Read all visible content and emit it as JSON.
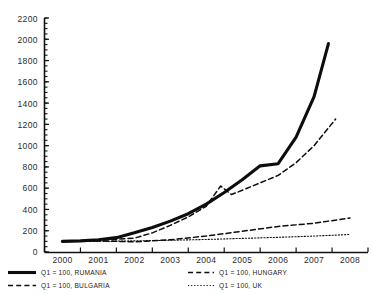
{
  "chart_data": {
    "type": "line",
    "title": "",
    "xlabel": "",
    "ylabel": "",
    "grid": false,
    "legend_position": "bottom",
    "x": [
      2000,
      2001,
      2002,
      2003,
      2004,
      2005,
      2006,
      2007,
      2008
    ],
    "xlim": [
      2000,
      2008
    ],
    "ylim": [
      0,
      2200
    ],
    "ytick_labels": [
      "2200",
      "2000",
      "1800",
      "1600",
      "1400",
      "1200",
      "1000",
      "800",
      "600",
      "400",
      "200",
      "0"
    ],
    "ytick_values": [
      2200,
      2000,
      1800,
      1600,
      1400,
      1200,
      1000,
      800,
      600,
      400,
      200,
      0
    ],
    "ytick_step": 200,
    "xtick_labels": [
      "2000",
      "2001",
      "2002",
      "2003",
      "2004",
      "2005",
      "2006",
      "2007",
      "2008"
    ],
    "series": [
      {
        "name": "Q1 = 100, RUMANIA",
        "style": "solid-thick",
        "x": [
          2000,
          2000.5,
          2001,
          2001.5,
          2002,
          2002.5,
          2003,
          2003.5,
          2004,
          2004.5,
          2005,
          2005.5,
          2006,
          2006.5,
          2007,
          2007.4
        ],
        "values": [
          100,
          105,
          115,
          135,
          180,
          230,
          290,
          360,
          450,
          560,
          680,
          810,
          830,
          1080,
          1460,
          1960
        ]
      },
      {
        "name": "Q1 = 100, BULGARIA",
        "style": "dashed",
        "x": [
          2000,
          2001,
          2002,
          2003,
          2004,
          2005,
          2006,
          2007,
          2008
        ],
        "values": [
          100,
          105,
          95,
          115,
          150,
          195,
          240,
          270,
          320
        ]
      },
      {
        "name": "Q1 = 100, HUNGARY",
        "style": "dashed",
        "x": [
          2000,
          2001,
          2002,
          2002.5,
          2003,
          2003.5,
          2004,
          2004.4,
          2004.7,
          2005,
          2005.5,
          2006,
          2006.5,
          2007,
          2007.6
        ],
        "values": [
          100,
          110,
          130,
          180,
          250,
          330,
          430,
          620,
          540,
          580,
          650,
          720,
          840,
          1000,
          1250
        ]
      },
      {
        "name": "Q1 = 100, UK",
        "style": "dotted",
        "x": [
          2000,
          2001,
          2002,
          2003,
          2004,
          2005,
          2006,
          2007,
          2008
        ],
        "values": [
          100,
          100,
          105,
          110,
          118,
          128,
          138,
          150,
          165
        ]
      }
    ]
  },
  "axis": {
    "y_labels": [
      "2200",
      "2000",
      "1800",
      "1600",
      "1400",
      "1200",
      "1000",
      "800",
      "600",
      "400",
      "200",
      "0"
    ],
    "x_labels": [
      "2000",
      "2001",
      "2002",
      "2003",
      "2004",
      "2005",
      "2006",
      "2007",
      "2008"
    ]
  },
  "legend": {
    "items": [
      {
        "label": "Q1 = 100, RUMANIA",
        "style": "solid-thick",
        "column": "left"
      },
      {
        "label": "Q1 = 100, BULGARIA",
        "style": "dashed",
        "column": "left"
      },
      {
        "label": "Q1 = 100, HUNGARY",
        "style": "dashed",
        "column": "right"
      },
      {
        "label": "Q1 = 100, UK",
        "style": "dotted",
        "column": "right"
      }
    ]
  },
  "colors": {
    "ink": "#0d0d0d",
    "background": "#ffffff",
    "text": "#2b2b2b"
  }
}
